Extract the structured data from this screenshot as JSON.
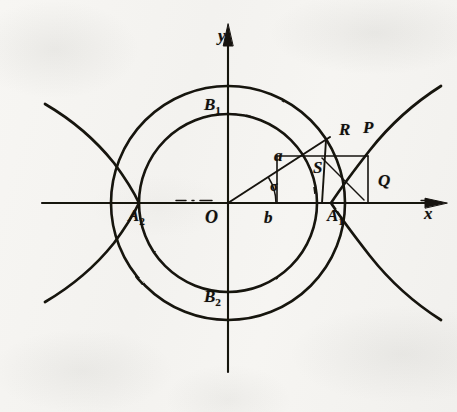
{
  "figure": {
    "kind": "hyperbola-construction-diagram",
    "background_color": "#f6f5f2",
    "ink_color": "#16130f"
  },
  "axes": {
    "x_label": "x",
    "y_label": "y",
    "origin_label": "O",
    "x_range_px": [
      42,
      447
    ],
    "y_range_px": [
      24,
      372
    ],
    "origin_px": [
      228,
      203
    ],
    "arrow_style": "solid-filled"
  },
  "circles": {
    "outer": {
      "name": "outer-circle",
      "radius_px": 117,
      "semi_axis_label": "a"
    },
    "inner": {
      "name": "inner-circle",
      "radius_px": 89,
      "semi_axis_label": "b"
    }
  },
  "ray": {
    "name": "radius-ray",
    "angle_label": "σ",
    "angle_degrees": 33,
    "length_label": "a"
  },
  "labels": {
    "a": "a",
    "b": "b",
    "sigma": "σ",
    "A1": "A",
    "A1_sub": "1",
    "A2": "A",
    "A2_sub": "2",
    "B1": "B",
    "B1_sub": "1",
    "B2": "B",
    "B2_sub": "2",
    "P": "P",
    "Q": "Q",
    "R": "R",
    "S": "S",
    "x": "x",
    "y": "y",
    "O": "O"
  },
  "points": [
    {
      "id": "O",
      "label": "O",
      "role": "origin",
      "px": [
        228,
        203
      ]
    },
    {
      "id": "A1",
      "label": "A1",
      "role": "right-vertex-inner-circle",
      "px": [
        317,
        203
      ]
    },
    {
      "id": "A2",
      "label": "A2",
      "role": "left-vertex-inner-circle",
      "px": [
        139,
        203
      ]
    },
    {
      "id": "B1",
      "label": "B1",
      "role": "top-of-outer-circle",
      "px": [
        228,
        86
      ]
    },
    {
      "id": "B2",
      "label": "B2",
      "role": "bottom-of-outer-circle",
      "px": [
        228,
        320
      ]
    },
    {
      "id": "R",
      "label": "R",
      "role": "ray-meets-outer-circle",
      "px": [
        326,
        140
      ]
    },
    {
      "id": "S",
      "label": "S",
      "role": "ray-meets-inner-circle",
      "px": [
        303,
        155
      ]
    },
    {
      "id": "P",
      "label": "P",
      "role": "point-on-hyperbola",
      "px": [
        355,
        145
      ]
    },
    {
      "id": "Q",
      "label": "Q",
      "role": "rectangle-corner",
      "px": [
        368,
        196
      ]
    }
  ],
  "hyperbola": {
    "name": "hyperbola",
    "branches": [
      "right",
      "left"
    ],
    "vertex_right_px": [
      330,
      203
    ],
    "vertex_left_px": [
      139,
      203
    ]
  },
  "construction": {
    "rectangle": {
      "name": "construction-rectangle",
      "x": 277,
      "y": 155,
      "w": 91,
      "h": 48
    },
    "dash_segment_on_x_axis": {
      "from_px": [
        175,
        203
      ],
      "to_px": [
        213,
        203
      ],
      "style": "dash-dot"
    }
  }
}
